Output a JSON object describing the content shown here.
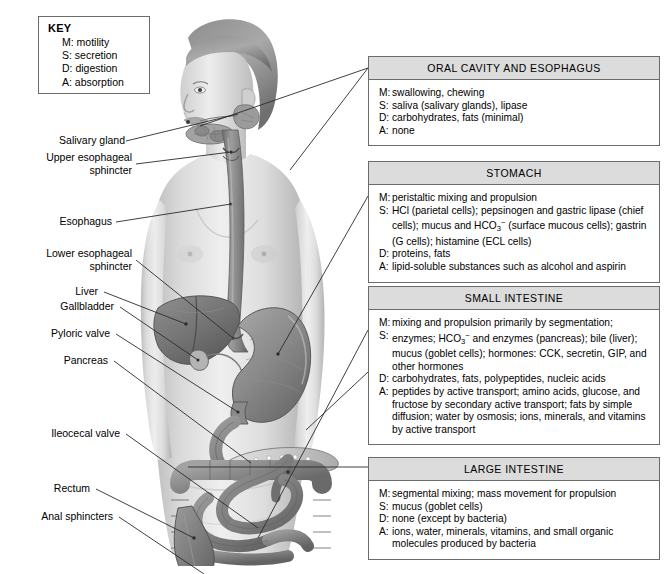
{
  "key": {
    "title": "KEY",
    "lines": [
      "M: motility",
      "S: secretion",
      "D: digestion",
      "A: absorption"
    ]
  },
  "labels": [
    {
      "name": "salivary-gland",
      "text": "Salivary gland"
    },
    {
      "name": "upper-esophageal-sphincter",
      "text": "Upper esophageal\nsphincter"
    },
    {
      "name": "esophagus",
      "text": "Esophagus"
    },
    {
      "name": "lower-esophageal-sphincter",
      "text": "Lower esophageal\nsphincter"
    },
    {
      "name": "liver",
      "text": "Liver"
    },
    {
      "name": "gallbladder",
      "text": "Gallbladder"
    },
    {
      "name": "pyloric-valve",
      "text": "Pyloric valve"
    },
    {
      "name": "pancreas",
      "text": "Pancreas"
    },
    {
      "name": "ileocecal-valve",
      "text": "Ileocecal valve"
    },
    {
      "name": "rectum",
      "text": "Rectum"
    },
    {
      "name": "anal-sphincters",
      "text": "Anal sphincters"
    }
  ],
  "panels": [
    {
      "id": "oral",
      "title": "ORAL CAVITY AND ESOPHAGUS",
      "rows": [
        {
          "tag": "M:",
          "html": "swallowing, chewing"
        },
        {
          "tag": "S:",
          "html": "saliva (salivary glands), lipase"
        },
        {
          "tag": "D:",
          "html": "carbohydrates, fats (minimal)"
        },
        {
          "tag": "A:",
          "html": "none"
        }
      ]
    },
    {
      "id": "stomach",
      "title": "STOMACH",
      "rows": [
        {
          "tag": "M:",
          "html": "peristaltic mixing and propulsion"
        },
        {
          "tag": "S:",
          "html": "HCl (parietal cells); pepsinogen and gastric lipase (chief cells); mucus and HCO<sub>3</sub><sup>&minus;</sup> (surface mucous cells); gastrin (G cells); histamine (ECL cells)"
        },
        {
          "tag": "D:",
          "html": "proteins, fats"
        },
        {
          "tag": "A:",
          "html": "lipid-soluble substances such as alcohol and aspirin"
        }
      ]
    },
    {
      "id": "small",
      "title": "SMALL INTESTINE",
      "rows": [
        {
          "tag": "M:",
          "html": "mixing and propulsion primarily by segmentation;"
        },
        {
          "tag": "S:",
          "html": "enzymes; HCO<sub>3</sub><sup>&minus;</sup> and enzymes (pancreas); bile (liver); mucus (goblet cells); hormones: CCK, secretin, GIP, and other hormones"
        },
        {
          "tag": "D:",
          "html": "carbohydrates, fats, polypeptides, nucleic acids"
        },
        {
          "tag": "A:",
          "html": "peptides by active transport; amino acids, glucose, and fructose by secondary active transport; fats by simple diffusion; water by osmosis; ions, minerals, and vitamins by active transport"
        }
      ]
    },
    {
      "id": "large",
      "title": "LARGE INTESTINE",
      "rows": [
        {
          "tag": "M:",
          "html": "segmental mixing; mass movement for propulsion"
        },
        {
          "tag": "S:",
          "html": "mucus (goblet  cells)"
        },
        {
          "tag": "D:",
          "html": "none (except by bacteria)"
        },
        {
          "tag": "A:",
          "html": "ions, water, minerals, vitamins, and small organic molecules produced by bacteria"
        }
      ]
    }
  ],
  "colors": {
    "panel_header_fill": "#dcdcdc",
    "panel_border": "#6b6b6b",
    "leader_line": "#2b2b2b",
    "page_background": "#ffffff"
  }
}
